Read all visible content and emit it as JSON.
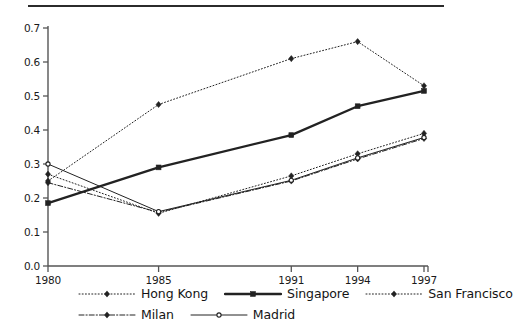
{
  "chart_data": {
    "type": "line",
    "title": "",
    "xlabel": "",
    "ylabel": "",
    "categories": [
      "1980",
      "1985",
      "1991",
      "1994",
      "1997"
    ],
    "x": [
      1980,
      1985,
      1991,
      1994,
      1997
    ],
    "xlim": [
      1980,
      1997
    ],
    "ylim": [
      0.0,
      0.7
    ],
    "grid": false,
    "legend_position": "bottom",
    "yticks": [
      "0.0",
      "0.1",
      "0.2",
      "0.3",
      "0.4",
      "0.5",
      "0.6",
      "0.7"
    ],
    "ytick_values": [
      0.0,
      0.1,
      0.2,
      0.3,
      0.4,
      0.5,
      0.6,
      0.7
    ],
    "xticks": [
      "1980",
      "1985",
      "1991",
      "1994",
      "1997"
    ],
    "series": [
      {
        "name": "Hong Kong",
        "style": "dotted",
        "marker": "diamond",
        "x": [
          1980,
          1985,
          1991,
          1994,
          1997
        ],
        "values": [
          0.25,
          0.475,
          0.61,
          0.66,
          0.53
        ]
      },
      {
        "name": "Singapore",
        "style": "solid-thick",
        "marker": "square",
        "x": [
          1980,
          1985,
          1991,
          1994,
          1997
        ],
        "values": [
          0.185,
          0.29,
          0.385,
          0.47,
          0.515
        ]
      },
      {
        "name": "San Francisco",
        "style": "dashed-dotted",
        "marker": "diamond",
        "x": [
          1980,
          1985,
          1991,
          1994,
          1997
        ],
        "values": [
          0.27,
          0.155,
          0.265,
          0.33,
          0.39
        ]
      },
      {
        "name": "Milan",
        "style": "dash-dot",
        "marker": "diamond",
        "x": [
          1980,
          1985,
          1991,
          1994,
          1997
        ],
        "values": [
          0.245,
          0.158,
          0.25,
          0.315,
          0.375
        ]
      },
      {
        "name": "Madrid",
        "style": "solid-thin",
        "marker": "circle",
        "x": [
          1980,
          1985,
          1991,
          1994,
          1997
        ],
        "values": [
          0.3,
          0.16,
          0.252,
          0.318,
          0.378
        ]
      }
    ]
  },
  "axis": {
    "ytick_labels": [
      "0.7",
      "0.6",
      "0.5",
      "0.4",
      "0.3",
      "0.2",
      "0.1",
      "0.0"
    ],
    "xtick_labels": [
      "1980",
      "1985",
      "1991",
      "1994",
      "1997"
    ]
  },
  "legend": {
    "rows": [
      [
        {
          "label": "Hong Kong",
          "style": "dotted",
          "marker": "diamond"
        },
        {
          "label": "Singapore",
          "style": "solid-thick",
          "marker": "square"
        },
        {
          "label": "San Francisco",
          "style": "dashed-dotted",
          "marker": "diamond"
        }
      ],
      [
        {
          "label": "Milan",
          "style": "dash-dot",
          "marker": "diamond"
        },
        {
          "label": "Madrid",
          "style": "solid-thin",
          "marker": "circle"
        }
      ]
    ]
  },
  "colors": {
    "ink": "#1a1a1a",
    "line": "#222222",
    "axis": "#555555",
    "background": "#ffffff"
  }
}
